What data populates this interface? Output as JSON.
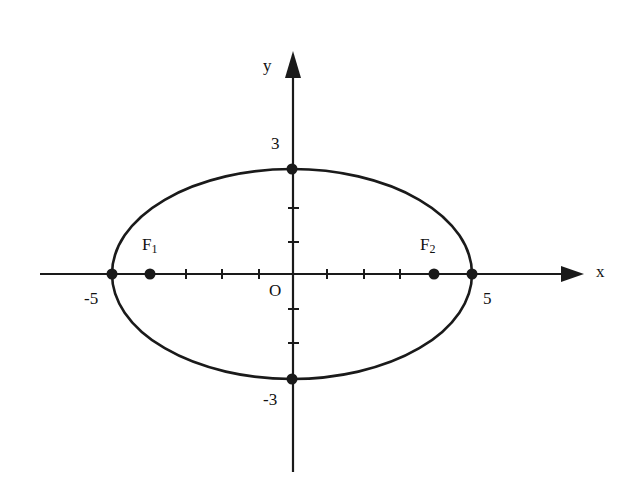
{
  "diagram": {
    "type": "ellipse",
    "equation_params": {
      "a": 5,
      "b": 3,
      "c": 4
    },
    "center": "O",
    "axes": {
      "x_label": "x",
      "y_label": "y"
    },
    "labels": {
      "origin": "O",
      "x_neg": "-5",
      "x_pos": "5",
      "y_pos": "3",
      "y_neg": "-3",
      "focus1": "F",
      "focus1_sub": "1",
      "focus2": "F",
      "focus2_sub": "2"
    },
    "points": [
      {
        "name": "vertex-left",
        "x": -5,
        "y": 0
      },
      {
        "name": "vertex-right",
        "x": 5,
        "y": 0
      },
      {
        "name": "co-vertex-top",
        "x": 0,
        "y": 3
      },
      {
        "name": "co-vertex-bottom",
        "x": 0,
        "y": -3
      },
      {
        "name": "F1",
        "x": -4,
        "y": 0
      },
      {
        "name": "F2",
        "x": 4,
        "y": 0
      }
    ],
    "x_ticks": [
      -4,
      -3,
      -2,
      -1,
      1,
      2,
      3,
      4
    ],
    "y_ticks": [
      -2,
      -1,
      1,
      2
    ],
    "stroke_color": "#1a1a1a",
    "background": "#ffffff"
  }
}
